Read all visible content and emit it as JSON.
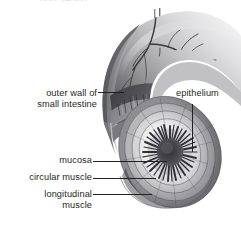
{
  "figure": {
    "top_cropped_text": "cross-section",
    "background_color": "#ffffff",
    "ink_color": "#231f20",
    "illustration_style": "grayscale anatomical airbrush illustration",
    "width": 241,
    "height": 227
  },
  "labels": {
    "outer_wall": "outer wall of\nsmall intestine",
    "epithelium": "epithelium",
    "mucosa": "mucosa",
    "circular_muscle": "circular muscle",
    "longitudinal_muscle": "longitudinal\nmuscle"
  },
  "leaders": [
    {
      "name": "outer-wall-leader",
      "x1": 98,
      "y1": 92,
      "x2": 124,
      "y2": 92
    },
    {
      "name": "epithelium-leader",
      "x1": 192,
      "y1": 104,
      "x2": 192,
      "y2": 152
    },
    {
      "name": "mucosa-leader",
      "x1": 93,
      "y1": 161,
      "x2": 167,
      "y2": 161
    },
    {
      "name": "circular-muscle-leader",
      "x1": 93,
      "y1": 178,
      "x2": 156,
      "y2": 178
    },
    {
      "name": "longitudinal-muscle-leader",
      "x1": 93,
      "y1": 194,
      "x2": 152,
      "y2": 194
    }
  ],
  "anatomy_parts": [
    "serosa / outer wall",
    "longitudinal muscle",
    "circular muscle",
    "submucosa",
    "mucosa with villi",
    "epithelium",
    "lumen",
    "mesenteric blood vessels"
  ]
}
